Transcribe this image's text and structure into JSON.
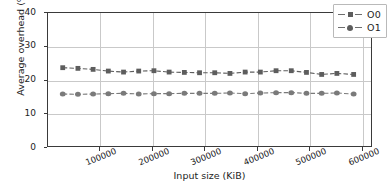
{
  "chart_data": {
    "type": "line",
    "title": "",
    "subtitle": "",
    "xlabel": "Input size (KiB)",
    "ylabel": "Average overhead (%)",
    "xlim": [
      0,
      620000
    ],
    "ylim": [
      0,
      40
    ],
    "grid": true,
    "legend_position": "upper right",
    "xticks": [
      100000,
      200000,
      300000,
      400000,
      500000,
      600000
    ],
    "xtick_labels": [
      "100000",
      "200000",
      "300000",
      "400000",
      "500000",
      "600000"
    ],
    "yticks": [
      0,
      10,
      20,
      30,
      40
    ],
    "ytick_labels": [
      "0",
      "10",
      "20",
      "30",
      "40"
    ],
    "x": [
      30000,
      59000,
      88000,
      117000,
      146000,
      175000,
      204000,
      233000,
      262000,
      291000,
      320000,
      349000,
      378000,
      407000,
      437000,
      466000,
      495000,
      524000,
      553000,
      585000
    ],
    "series": [
      {
        "name": "O0",
        "marker": "square",
        "color": "#5d5d5d",
        "values": [
          23.5,
          23.3,
          23.0,
          22.5,
          22.2,
          22.5,
          22.6,
          22.2,
          22.1,
          22.0,
          22.0,
          21.8,
          22.2,
          22.2,
          22.6,
          22.6,
          22.1,
          21.5,
          21.8,
          21.5
        ]
      },
      {
        "name": "O1",
        "marker": "diamond",
        "color": "#7a7a7a",
        "values": [
          15.7,
          15.6,
          15.7,
          15.8,
          15.9,
          15.7,
          15.8,
          15.8,
          15.9,
          15.9,
          15.9,
          16.0,
          15.8,
          16.0,
          16.1,
          16.1,
          15.9,
          15.9,
          16.0,
          15.7
        ]
      }
    ]
  },
  "legend": {
    "entries": [
      {
        "label": "O0"
      },
      {
        "label": "O1"
      }
    ]
  },
  "colors": {
    "series_o0": "#5d5d5d",
    "series_o1": "#7a7a7a",
    "grid": "#c9c9c9",
    "frame": "#3a3a3a",
    "text": "#1d1d1d",
    "background": "#ffffff"
  }
}
